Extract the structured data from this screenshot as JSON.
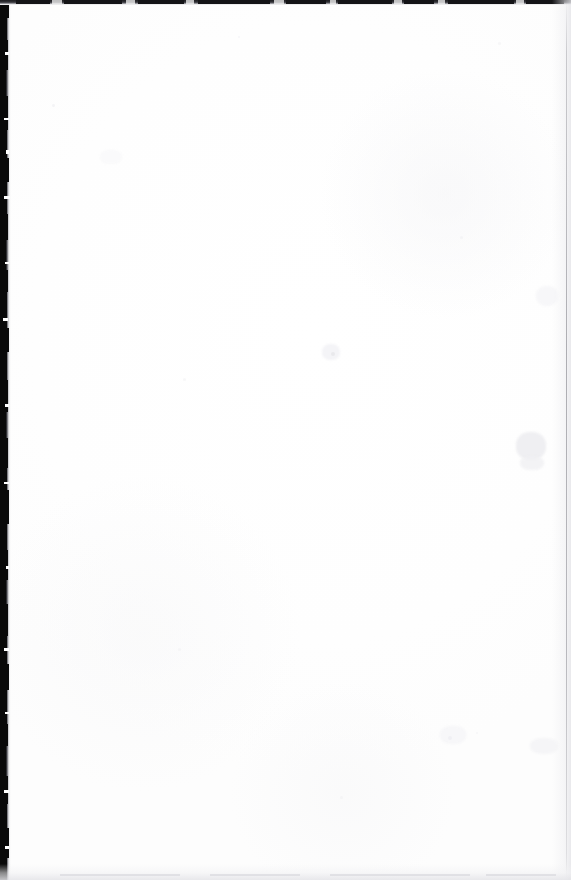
{
  "document": {
    "page_kind": "scanned-blank-page",
    "page_text": "",
    "body_text": "",
    "header_text": "",
    "footer_text": "",
    "page_number": "",
    "visible_text_present": false
  },
  "canvas": {
    "width": 571,
    "height": 880
  },
  "colors": {
    "paper": "#ffffff",
    "paper_tint": "#fdfdfd",
    "gutter_dark": "#090909",
    "top_edge_dark": "#1b1b1e",
    "right_edge_line": "#969a9c",
    "bottom_edge_gray": "#e4e4e8",
    "speck_gray": "#ededf0"
  },
  "artifacts": {
    "gutter": {
      "name": "left-binding-shadow",
      "edge": "left",
      "width_px": 11
    },
    "top_edge": {
      "name": "top-scan-edge",
      "edge": "top",
      "height_px": 5
    },
    "right_edge": {
      "name": "right-page-edge-line",
      "edge": "right",
      "x_px": 566
    },
    "bottom_edge": {
      "name": "bottom-scan-falloff",
      "edge": "bottom",
      "height_px": 16
    },
    "gutter_notches": [
      {
        "top": 2,
        "height": 16,
        "width": 9
      },
      {
        "top": 18,
        "height": 22,
        "width": 7
      },
      {
        "top": 40,
        "height": 30,
        "width": 8
      },
      {
        "top": 70,
        "height": 26,
        "width": 6
      },
      {
        "top": 96,
        "height": 34,
        "width": 8
      },
      {
        "top": 130,
        "height": 28,
        "width": 7
      },
      {
        "top": 158,
        "height": 24,
        "width": 9
      },
      {
        "top": 182,
        "height": 32,
        "width": 7
      },
      {
        "top": 214,
        "height": 26,
        "width": 8
      },
      {
        "top": 240,
        "height": 30,
        "width": 6
      },
      {
        "top": 270,
        "height": 22,
        "width": 8
      },
      {
        "top": 292,
        "height": 36,
        "width": 7
      },
      {
        "top": 328,
        "height": 24,
        "width": 9
      },
      {
        "top": 352,
        "height": 28,
        "width": 7
      },
      {
        "top": 380,
        "height": 32,
        "width": 8
      },
      {
        "top": 412,
        "height": 26,
        "width": 6
      },
      {
        "top": 438,
        "height": 30,
        "width": 8
      },
      {
        "top": 468,
        "height": 22,
        "width": 7
      },
      {
        "top": 490,
        "height": 34,
        "width": 9
      },
      {
        "top": 524,
        "height": 26,
        "width": 7
      },
      {
        "top": 550,
        "height": 30,
        "width": 8
      },
      {
        "top": 580,
        "height": 24,
        "width": 6
      },
      {
        "top": 604,
        "height": 32,
        "width": 8
      },
      {
        "top": 636,
        "height": 28,
        "width": 7
      },
      {
        "top": 664,
        "height": 26,
        "width": 9
      },
      {
        "top": 690,
        "height": 34,
        "width": 7
      },
      {
        "top": 724,
        "height": 22,
        "width": 8
      },
      {
        "top": 746,
        "height": 30,
        "width": 6
      },
      {
        "top": 776,
        "height": 28,
        "width": 8
      },
      {
        "top": 804,
        "height": 24,
        "width": 7
      },
      {
        "top": 828,
        "height": 30,
        "width": 9
      },
      {
        "top": 858,
        "height": 22,
        "width": 7
      }
    ],
    "gutter_light_nicks": [
      {
        "top": 52,
        "left": 5,
        "width": 4,
        "height": 3
      },
      {
        "top": 118,
        "left": 4,
        "width": 5,
        "height": 2
      },
      {
        "top": 150,
        "left": 6,
        "width": 3,
        "height": 4
      },
      {
        "top": 196,
        "left": 4,
        "width": 6,
        "height": 3
      },
      {
        "top": 262,
        "left": 5,
        "width": 4,
        "height": 2
      },
      {
        "top": 318,
        "left": 3,
        "width": 5,
        "height": 3
      },
      {
        "top": 404,
        "left": 5,
        "width": 4,
        "height": 3
      },
      {
        "top": 482,
        "left": 4,
        "width": 5,
        "height": 2
      },
      {
        "top": 566,
        "left": 6,
        "width": 3,
        "height": 3
      },
      {
        "top": 648,
        "left": 4,
        "width": 5,
        "height": 3
      },
      {
        "top": 712,
        "left": 5,
        "width": 4,
        "height": 2
      },
      {
        "top": 790,
        "left": 4,
        "width": 5,
        "height": 3
      },
      {
        "top": 846,
        "left": 5,
        "width": 4,
        "height": 3
      }
    ],
    "top_edge_mottle": [
      {
        "left": 16,
        "width": 34
      },
      {
        "left": 64,
        "width": 58
      },
      {
        "left": 138,
        "width": 46
      },
      {
        "left": 198,
        "width": 72
      },
      {
        "left": 286,
        "width": 40
      },
      {
        "left": 338,
        "width": 54
      },
      {
        "left": 404,
        "width": 30
      },
      {
        "left": 448,
        "width": 66
      },
      {
        "left": 526,
        "width": 38
      }
    ],
    "top_edge_light": [
      {
        "left": 52,
        "width": 10
      },
      {
        "left": 126,
        "width": 9
      },
      {
        "left": 186,
        "width": 8
      },
      {
        "left": 274,
        "width": 10
      },
      {
        "left": 330,
        "width": 6
      },
      {
        "left": 394,
        "width": 8
      },
      {
        "left": 438,
        "width": 7
      },
      {
        "left": 516,
        "width": 8
      }
    ],
    "bottom_streaks": [
      {
        "left": 60,
        "width": 120
      },
      {
        "left": 210,
        "width": 90
      },
      {
        "left": 330,
        "width": 140
      },
      {
        "left": 486,
        "width": 70
      }
    ],
    "specks": [
      {
        "name": "speck-center-upper",
        "left": 331,
        "top": 352,
        "size": 4,
        "color": "#e6e6ea",
        "opacity": 0.85
      },
      {
        "name": "speck-left-upper",
        "left": 52,
        "top": 104,
        "size": 3,
        "color": "#f0f0f2",
        "opacity": 0.7
      },
      {
        "name": "speck-mid-left",
        "left": 183,
        "top": 378,
        "size": 3,
        "color": "#f1f1f3",
        "opacity": 0.6
      },
      {
        "name": "speck-right-mid",
        "left": 460,
        "top": 236,
        "size": 3,
        "color": "#f0f0f3",
        "opacity": 0.6
      },
      {
        "name": "speck-lower-mid",
        "left": 448,
        "top": 736,
        "size": 4,
        "color": "#eeeef1",
        "opacity": 0.75
      },
      {
        "name": "speck-lower-right",
        "left": 476,
        "top": 732,
        "size": 2,
        "color": "#f2f2f4",
        "opacity": 0.6
      },
      {
        "name": "speck-low-left",
        "left": 178,
        "top": 648,
        "size": 3,
        "color": "#f1f1f4",
        "opacity": 0.6
      },
      {
        "name": "speck-bottom-mid",
        "left": 340,
        "top": 796,
        "size": 3,
        "color": "#f0f0f3",
        "opacity": 0.55
      },
      {
        "name": "speck-top-right",
        "left": 498,
        "top": 42,
        "size": 3,
        "color": "#f1f1f3",
        "opacity": 0.6
      },
      {
        "name": "speck-top-mid",
        "left": 238,
        "top": 36,
        "size": 2,
        "color": "#f2f2f5",
        "opacity": 0.5
      }
    ],
    "smudges": [
      {
        "name": "smudge-right-mid",
        "left": 516,
        "top": 432,
        "width": 30,
        "height": 28,
        "color": "rgba(236,236,240,0.85)"
      },
      {
        "name": "smudge-right-lower",
        "left": 520,
        "top": 456,
        "width": 24,
        "height": 14,
        "color": "rgba(240,240,243,0.8)"
      },
      {
        "name": "smudge-right-upper",
        "left": 536,
        "top": 286,
        "width": 22,
        "height": 20,
        "color": "rgba(243,243,246,0.7)"
      },
      {
        "name": "smudge-center",
        "left": 322,
        "top": 344,
        "width": 18,
        "height": 16,
        "color": "rgba(240,240,244,0.75)"
      },
      {
        "name": "smudge-lower-center",
        "left": 440,
        "top": 726,
        "width": 26,
        "height": 18,
        "color": "rgba(243,243,246,0.7)"
      },
      {
        "name": "smudge-right-low",
        "left": 530,
        "top": 738,
        "width": 28,
        "height": 16,
        "color": "rgba(241,241,245,0.65)"
      },
      {
        "name": "smudge-upper-left",
        "left": 100,
        "top": 150,
        "width": 22,
        "height": 14,
        "color": "rgba(246,246,248,0.6)"
      }
    ]
  }
}
